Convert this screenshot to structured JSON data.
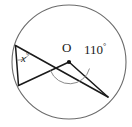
{
  "figure": {
    "center_label": "O",
    "central_angle_label": "110",
    "central_angle_degree_symbol": "°",
    "inscribed_angle_label": "x",
    "inscribed_angle_degree_symbol": "°",
    "colors": {
      "background": "#ffffff",
      "circle_stroke": "#6b6b6b",
      "chord_stroke": "#1a1a1a",
      "arc_marker_stroke": "#8a8a8a",
      "point_fill": "#111111",
      "text": "#1a1a1a"
    },
    "geometry": {
      "circle": {
        "cx": 69,
        "cy": 62,
        "r": 57
      },
      "points": [
        {
          "name": "center-O",
          "x": 69,
          "y": 62
        },
        {
          "name": "vertex-top-left",
          "x": 15.5,
          "y": 45.5
        },
        {
          "name": "vertex-bottom-left",
          "x": 18.5,
          "y": 85.5
        },
        {
          "name": "vertex-right",
          "x": 108,
          "y": 97
        }
      ],
      "segments": [
        {
          "name": "chord-topleft-bottomleft",
          "x1": 15.5,
          "y1": 45.5,
          "x2": 18.5,
          "y2": 85.5
        },
        {
          "name": "chord-topleft-right",
          "x1": 15.5,
          "y1": 45.5,
          "x2": 108,
          "y2": 97
        },
        {
          "name": "radius-O-bottomleft",
          "x1": 69,
          "y1": 62,
          "x2": 18.5,
          "y2": 85.5
        },
        {
          "name": "radius-O-right",
          "x1": 69,
          "y1": 62,
          "x2": 108,
          "y2": 97
        }
      ],
      "angle_arcs": [
        {
          "name": "central-angle-arc",
          "d": "M 50 71 A 21 21 0 0 0 90 68"
        },
        {
          "name": "inscribed-angle-arc",
          "d": "M 17.6 60.8 A 15 15 0 0 0 29.6 53.2"
        }
      ]
    }
  }
}
